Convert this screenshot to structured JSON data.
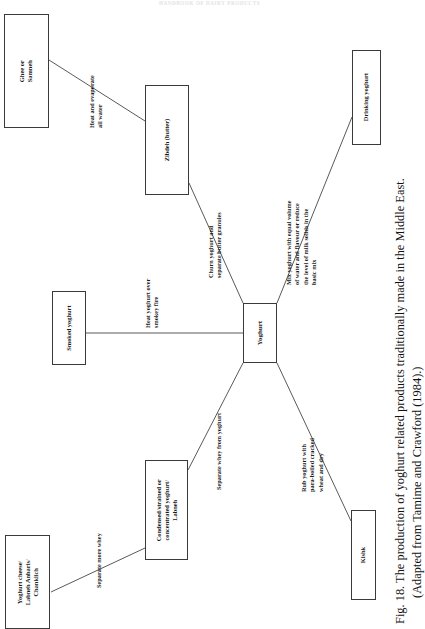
{
  "page": {
    "running_head": "HANDBOOK OF DAIRY PRODUCTS",
    "background_color": "#ffffff",
    "ink_color": "#1a1a1a",
    "width": 419,
    "height": 629,
    "orientation": "figure rotated 90 degrees counter-clockwise on the page"
  },
  "figure": {
    "number": "Fig. 18.",
    "caption_line1": "Fig. 18.  The production of yoghurt related products traditionally made in the Middle East.",
    "caption_line2": "(Adapted from Tamime and Crawford (1984).)",
    "source": "Tamime and Crawford (1984)"
  },
  "diagram": {
    "type": "flow-diagram",
    "root": "yoghurt",
    "nodes": [
      {
        "id": "ghee",
        "label": "Ghee or\nSamneh",
        "lines": [
          "Ghee or",
          "Samneh"
        ]
      },
      {
        "id": "zibdeh",
        "label": "Zibdeh (butter)",
        "lines": [
          "Zibdeh (butter)"
        ]
      },
      {
        "id": "drinking-yoghurt",
        "label": "Drinking yoghurt",
        "lines": [
          "Drinking yoghurt"
        ]
      },
      {
        "id": "smoked-yoghurt",
        "label": "Smoked yoghurt",
        "lines": [
          "Smoked yoghurt"
        ]
      },
      {
        "id": "yoghurt",
        "label": "Yoghurt",
        "lines": [
          "Yoghurt"
        ]
      },
      {
        "id": "labneh",
        "label": "Condensed/strained or concentrated yoghurt/ Labneh",
        "lines": [
          "Condensed/strained or",
          "concentrated yoghurt/",
          "Labneh"
        ]
      },
      {
        "id": "yoghurt-cheese",
        "label": "Yoghurt cheese/ Labneh Anbaris/ Chanklich",
        "lines": [
          "Yoghurt cheese/",
          "Labneh Anbaris/",
          "Chanklich"
        ]
      },
      {
        "id": "kishk",
        "label": "Kishk",
        "lines": [
          "Kishk"
        ]
      }
    ],
    "edges": [
      {
        "id": "e-zibdeh-ghee",
        "from": "zibdeh",
        "to": "ghee",
        "label": "Heat and evaporate all water",
        "lines": [
          "Heat and evaporate",
          "all water"
        ]
      },
      {
        "id": "e-yoghurt-zibdeh",
        "from": "yoghurt",
        "to": "zibdeh",
        "label": "Churn yoghurt and separate butter granules",
        "lines": [
          "Churn yoghurt and",
          "separate butter granules"
        ]
      },
      {
        "id": "e-yoghurt-drinking",
        "from": "yoghurt",
        "to": "drinking-yoghurt",
        "label": "Mix yoghurt with equal volume of water and flavour or reduce the level of milk solids in the basic mix",
        "lines": [
          "Mix yoghurt with equal volume",
          "of water and flavour or reduce",
          "the level of milk solids in the",
          "basic mix"
        ]
      },
      {
        "id": "e-yoghurt-smoked",
        "from": "yoghurt",
        "to": "smoked-yoghurt",
        "label": "Heat yoghurt over smokey fire",
        "lines": [
          "Heat yoghurt over",
          "smokey fire"
        ]
      },
      {
        "id": "e-yoghurt-labneh",
        "from": "yoghurt",
        "to": "labneh",
        "label": "Separate whey from yoghurt",
        "lines": [
          "Separate whey from yoghurt"
        ]
      },
      {
        "id": "e-labneh-cheese",
        "from": "labneh",
        "to": "yoghurt-cheese",
        "label": "Separate more whey",
        "lines": [
          "Separate more whey"
        ]
      },
      {
        "id": "e-yoghurt-kishk",
        "from": "yoghurt",
        "to": "kishk",
        "label": "Rub yoghurt with para-boiled cracked wheat and dry",
        "lines": [
          "Rub yoghurt with",
          "para-boiled cracked",
          "wheat and dry"
        ]
      }
    ]
  }
}
